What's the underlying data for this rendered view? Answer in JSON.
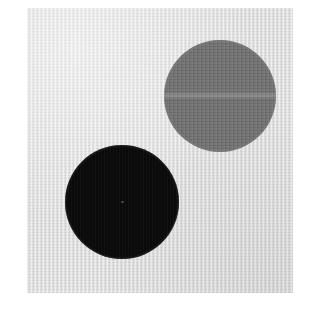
{
  "image": {
    "kind": "photograph-figure",
    "width": 325,
    "height": 313,
    "caption": "",
    "background_color": "#ffffff"
  },
  "panel": {
    "name": "light gray textured background panel",
    "color": "#dcdcdc",
    "left": 27,
    "top": 8,
    "width": 266,
    "height": 285,
    "texture": "fine vertical scan grain"
  },
  "objects": [
    {
      "id": "circle-dark",
      "label": "large black circle",
      "shape": "circle",
      "color": "#0a0a0a",
      "center_x": 122,
      "center_y": 202,
      "diameter": 114,
      "position": "lower-left"
    },
    {
      "id": "circle-gray",
      "label": "medium gray circle",
      "shape": "circle",
      "color": "#6e6e6e",
      "center_x": 220,
      "center_y": 96,
      "diameter": 112,
      "position": "upper-right"
    }
  ]
}
